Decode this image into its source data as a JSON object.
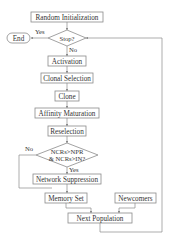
{
  "diagram": {
    "type": "flowchart",
    "nodes": {
      "random_init": "Random Initialization",
      "stop": "Stop?",
      "end": "End",
      "activation": "Activation",
      "clonal_selection": "Clonal Selection",
      "clone": "Clone",
      "affinity_maturation": "Affinity Maturation",
      "reselection": "Reselection",
      "condition_line1": "NCRs>NPR",
      "condition_line2": "& NCRs>IN?",
      "network_suppression": "Network Suppression",
      "memory_set": "Memory Set",
      "newcomers": "Newcomers",
      "next_population": "Next Population"
    },
    "edge_labels": {
      "stop_yes": "Yes",
      "stop_no": "No",
      "cond_yes": "Yes",
      "cond_no": "No"
    },
    "colors": {
      "stroke": "#8a8a8a",
      "text": "#333333",
      "background": "#ffffff"
    }
  }
}
